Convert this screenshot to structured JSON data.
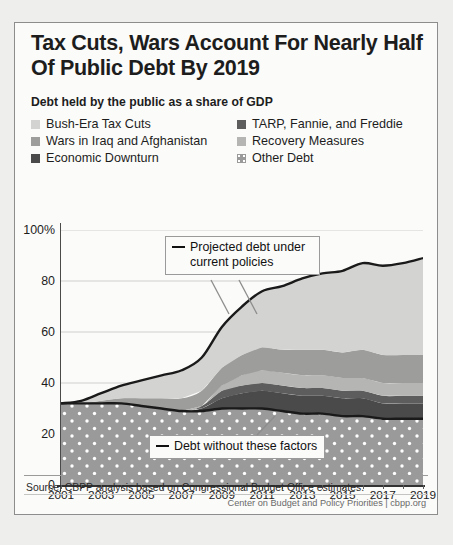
{
  "title": "Tax Cuts, Wars Account For Nearly Half Of Public Debt By 2019",
  "subtitle": "Debt held by the public as a share of GDP",
  "legend": [
    {
      "label": "Bush-Era Tax Cuts",
      "color": "#d3d3d1",
      "pattern": "solid"
    },
    {
      "label": "TARP, Fannie, and Freddie",
      "color": "#5d5d5d",
      "pattern": "solid"
    },
    {
      "label": "Wars in Iraq and Afghanistan",
      "color": "#9d9d9b",
      "pattern": "solid"
    },
    {
      "label": "Recovery Measures",
      "color": "#b5b5b3",
      "pattern": "solid"
    },
    {
      "label": "Economic Downturn",
      "color": "#4a4a4a",
      "pattern": "solid"
    },
    {
      "label": "Other Debt",
      "color": "#9a9a9a",
      "pattern": "dotted"
    }
  ],
  "annotations": [
    {
      "name": "projected-debt",
      "text_line1": "Projected debt under",
      "text_line2": "current policies"
    },
    {
      "name": "debt-without-factors",
      "text_line1": "Debt without these factors",
      "text_line2": ""
    }
  ],
  "source": "Source:  CBPP analysis based on Congressional Budget Office estimates.",
  "credit": "Center on Budget and Policy Priorities | cbpp.org",
  "chart_data": {
    "type": "area",
    "title": "Tax Cuts, Wars Account For Nearly Half Of Public Debt By 2019",
    "subtitle": "Debt held by the public as a share of GDP",
    "xlabel": "",
    "ylabel": "Percent of GDP",
    "ylim": [
      0,
      100
    ],
    "xlim": [
      2001,
      2019
    ],
    "yticks": [
      0,
      20,
      40,
      60,
      80,
      100
    ],
    "ytick_labels": [
      "0",
      "20",
      "40",
      "60",
      "80",
      "100%"
    ],
    "xticks": [
      2001,
      2003,
      2005,
      2007,
      2009,
      2011,
      2013,
      2015,
      2017,
      2019
    ],
    "grid": true,
    "legend_position": "top",
    "stacked": true,
    "x": [
      2001,
      2002,
      2003,
      2004,
      2005,
      2006,
      2007,
      2008,
      2009,
      2010,
      2011,
      2012,
      2013,
      2014,
      2015,
      2016,
      2017,
      2018,
      2019
    ],
    "series": [
      {
        "name": "Other Debt",
        "color": "#9a9a9a",
        "pattern": "dotted",
        "values": [
          32,
          32,
          32,
          32,
          31,
          30,
          29,
          29,
          30,
          30,
          30,
          29,
          28,
          28,
          27,
          27,
          26,
          26,
          26
        ]
      },
      {
        "name": "Economic Downturn",
        "color": "#4a4a4a",
        "values": [
          0,
          0,
          0,
          0,
          0,
          0,
          0,
          1,
          4,
          6,
          7,
          7,
          7,
          7,
          7,
          7,
          6,
          6,
          6
        ]
      },
      {
        "name": "TARP, Fannie, and Freddie",
        "color": "#5d5d5d",
        "values": [
          0,
          0,
          0,
          0,
          0,
          0,
          0,
          1,
          3,
          3,
          3,
          3,
          3,
          3,
          3,
          3,
          3,
          3,
          3
        ]
      },
      {
        "name": "Recovery Measures",
        "color": "#b5b5b3",
        "values": [
          0,
          0,
          0,
          0,
          0,
          0,
          0,
          0,
          2,
          4,
          5,
          5,
          5,
          5,
          5,
          5,
          5,
          5,
          5
        ]
      },
      {
        "name": "Wars in Iraq and Afghanistan",
        "color": "#9d9d9b",
        "values": [
          0,
          0,
          1,
          2,
          3,
          4,
          5,
          6,
          7,
          8,
          9,
          9,
          10,
          10,
          10,
          11,
          11,
          11,
          11
        ]
      },
      {
        "name": "Bush-Era Tax Cuts",
        "color": "#d3d3d1",
        "values": [
          0,
          1,
          3,
          5,
          7,
          9,
          11,
          13,
          16,
          19,
          22,
          25,
          28,
          30,
          32,
          34,
          35,
          36,
          38
        ]
      }
    ],
    "lines": [
      {
        "name": "Projected debt under current policies",
        "color": "#1a1a1a",
        "values": [
          32,
          33,
          36,
          39,
          41,
          43,
          45,
          50,
          62,
          70,
          76,
          78,
          81,
          83,
          84,
          87,
          86,
          87,
          89
        ]
      },
      {
        "name": "Debt without these factors",
        "color": "#1a1a1a",
        "values": [
          32,
          32,
          32,
          32,
          31,
          30,
          29,
          29,
          30,
          30,
          30,
          29,
          28,
          28,
          27,
          27,
          26,
          26,
          26
        ]
      }
    ]
  }
}
